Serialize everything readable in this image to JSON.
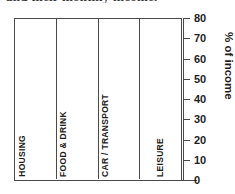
{
  "caption": {
    "text": "and their monthly income."
  },
  "chart_data": {
    "type": "bar",
    "title": "",
    "xlabel": "",
    "ylabel": "% of income",
    "ylim": [
      0,
      80
    ],
    "yticks": [
      0,
      10,
      20,
      30,
      40,
      50,
      60,
      70,
      80
    ],
    "grid": false,
    "legend": "none",
    "categories": [
      "HOUSING",
      "FOOD & DRINK",
      "CAR / TRANSPORT",
      "LEISURE"
    ],
    "series": [
      {
        "name": "series-1",
        "color": "#8c8c8c",
        "values": [
          50,
          30,
          10,
          30
        ]
      },
      {
        "name": "series-2",
        "color": "#9d9d9d",
        "values": [
          20,
          25,
          15,
          20
        ]
      },
      {
        "name": "series-3",
        "color": "#d9d9d9",
        "values": [
          40,
          30,
          5,
          null
        ]
      }
    ],
    "groups": [
      {
        "label": "HOUSING",
        "bars": [
          {
            "value": 50,
            "shade": "dark"
          },
          {
            "value": 20,
            "shade": "med"
          },
          {
            "value": 40,
            "shade": "light"
          }
        ]
      },
      {
        "label": "FOOD & DRINK",
        "bars": [
          {
            "value": 30,
            "shade": "dark"
          },
          {
            "value": 25,
            "shade": "med"
          },
          {
            "value": 30,
            "shade": "light"
          }
        ]
      },
      {
        "label": "CAR / TRANSPORT",
        "bars": [
          {
            "value": 10,
            "shade": "dark"
          },
          {
            "value": 15,
            "shade": "med"
          },
          {
            "value": 5,
            "shade": "light"
          }
        ]
      },
      {
        "label": "LEISURE",
        "bars": [
          {
            "value": 30,
            "shade": "dark"
          },
          {
            "value": 20,
            "shade": "light"
          }
        ]
      }
    ],
    "colors": {
      "dark": "#8c8c8c",
      "med": "#9d9d9d",
      "light": "#d9d9d9",
      "axis": "#4a4a4a",
      "text": "#1d1d1d",
      "background": "#ffffff"
    }
  }
}
